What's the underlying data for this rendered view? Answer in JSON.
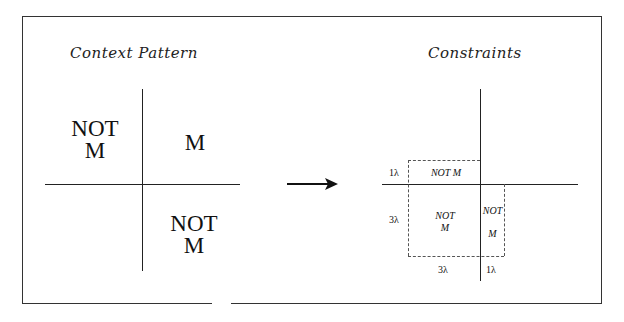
{
  "left_panel": {
    "title": "Context Pattern",
    "quadrants": {
      "top_left": [
        "NOT",
        "M"
      ],
      "top_right": "M",
      "bottom_right": [
        "NOT",
        "M"
      ]
    }
  },
  "right_panel": {
    "title": "Constraints",
    "regions": {
      "top_strip": "NOT M",
      "left_block": [
        "NOT",
        "M"
      ],
      "right_strip_top": "NOT",
      "right_strip_bottom": "M"
    },
    "dimensions": {
      "top_height": "1λ",
      "left_height": "3λ",
      "left_width": "3λ",
      "right_width": "1λ"
    }
  },
  "arrow": {
    "direction": "right",
    "icon": "arrow-right-icon"
  }
}
